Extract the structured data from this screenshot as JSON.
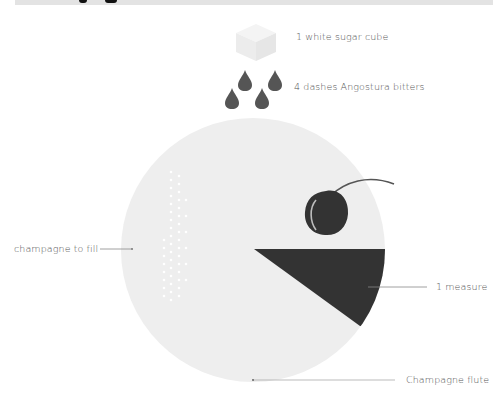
{
  "header": {
    "title_partial": "",
    "background": "#e3e3e3"
  },
  "diagram": {
    "ingredients": [
      {
        "label": "1 white sugar cube",
        "icon": "sugar-cube-icon"
      },
      {
        "label": "4 dashes Angostura bitters",
        "icon": "bitters-drops-icon"
      },
      {
        "label": "champagne to fill",
        "icon": "champagne-bubbles"
      },
      {
        "label": "1 measure",
        "icon": "brandy-wedge"
      },
      {
        "label": "Champagne flute",
        "icon": "glass-circle"
      }
    ],
    "garnish": "cherry-icon",
    "colors": {
      "glass": "#eeeeee",
      "dark": "#333333",
      "sugar": "#f1f1f1",
      "drop": "#555555",
      "leader": "#888888",
      "text": "#555555"
    }
  }
}
